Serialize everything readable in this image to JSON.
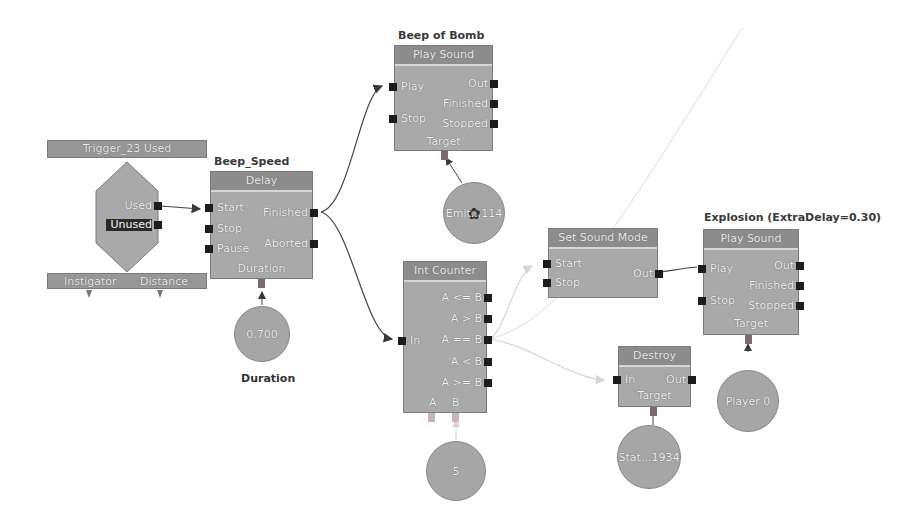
{
  "event_node": {
    "title": "Trigger_23 Used",
    "outputs": [
      "Used",
      "Unused"
    ],
    "variables": [
      "Instigator",
      "Distance"
    ]
  },
  "delay_node": {
    "label": "Beep_Speed",
    "title": "Delay",
    "inputs": [
      "Start",
      "Stop",
      "Pause"
    ],
    "outputs": [
      "Finished",
      "Aborted"
    ],
    "variable": "Duration",
    "var_value": "0.700",
    "var_caption": "Duration"
  },
  "beep_node": {
    "label": "Beep of Bomb",
    "title": "Play Sound",
    "inputs": [
      "Play",
      "Stop"
    ],
    "outputs": [
      "Out",
      "Finished",
      "Stopped"
    ],
    "variable": "Target",
    "var_value": "Emit...114"
  },
  "counter_node": {
    "title": "Int Counter",
    "input": "In",
    "outputs": [
      "A <= B",
      "A > B",
      "A == B",
      "A < B",
      "A >= B"
    ],
    "variables": [
      "A",
      "B"
    ],
    "var_value": "5"
  },
  "sound_mode_node": {
    "title": "Set Sound Mode",
    "inputs": [
      "Start",
      "Stop"
    ],
    "output": "Out"
  },
  "explosion_node": {
    "label": "Explosion (ExtraDelay=0.30)",
    "title": "Play Sound",
    "inputs": [
      "Play",
      "Stop"
    ],
    "outputs": [
      "Out",
      "Finished",
      "Stopped"
    ],
    "variable": "Target",
    "var_value": "Player 0"
  },
  "destroy_node": {
    "title": "Destroy",
    "input": "In",
    "output": "Out",
    "variable": "Target",
    "var_value": "Stat...1934"
  },
  "colors": {
    "node_body": "#a9a9a9",
    "node_header": "#8c8c8c",
    "port": "#1c1c1c",
    "link_active": "#555555",
    "link_faded": "#d9d9d9"
  }
}
